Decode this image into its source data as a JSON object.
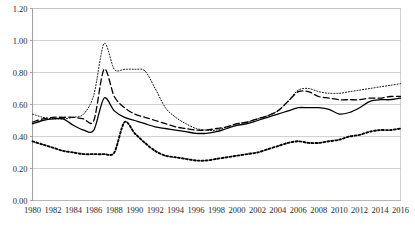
{
  "chart_data": {
    "type": "line",
    "title": "",
    "xlabel": "",
    "ylabel": "",
    "xlim": [
      1980,
      2016
    ],
    "ylim": [
      0.0,
      1.2
    ],
    "ytick_labels": [
      "0.00",
      "0.20",
      "0.40",
      "0.60",
      "0.80",
      "1.00",
      "1.20"
    ],
    "ytick_values": [
      0.0,
      0.2,
      0.4,
      0.6,
      0.8,
      1.0,
      1.2
    ],
    "xtick_labels": [
      "1980",
      "1982",
      "1984",
      "1986",
      "1988",
      "1990",
      "1992",
      "1994",
      "1996",
      "1998",
      "2000",
      "2002",
      "2004",
      "2006",
      "2008",
      "2010",
      "2012",
      "2014",
      "2016"
    ],
    "xtick_values": [
      1980,
      1982,
      1984,
      1986,
      1988,
      1990,
      1992,
      1994,
      1996,
      1998,
      2000,
      2002,
      2004,
      2006,
      2008,
      2010,
      2012,
      2014,
      2016
    ],
    "grid": true,
    "legend": null,
    "legend_position": "none",
    "x": [
      1980,
      1981,
      1982,
      1983,
      1984,
      1985,
      1986,
      1987,
      1988,
      1989,
      1990,
      1991,
      1992,
      1993,
      1994,
      1995,
      1996,
      1997,
      1998,
      1999,
      2000,
      2001,
      2002,
      2003,
      2004,
      2005,
      2006,
      2007,
      2008,
      2009,
      2010,
      2011,
      2012,
      2013,
      2014,
      2015,
      2016
    ],
    "series": [
      {
        "name": "series-fine-dotted",
        "style": "fine-dotted",
        "values": [
          0.54,
          0.52,
          0.51,
          0.51,
          0.52,
          0.54,
          0.66,
          0.98,
          0.82,
          0.82,
          0.82,
          0.81,
          0.7,
          0.58,
          0.52,
          0.48,
          0.45,
          0.44,
          0.44,
          0.46,
          0.48,
          0.49,
          0.51,
          0.53,
          0.56,
          0.62,
          0.69,
          0.7,
          0.68,
          0.67,
          0.67,
          0.68,
          0.69,
          0.7,
          0.71,
          0.72,
          0.73
        ]
      },
      {
        "name": "series-dashed",
        "style": "dashed",
        "values": [
          0.49,
          0.51,
          0.52,
          0.52,
          0.52,
          0.51,
          0.5,
          0.82,
          0.65,
          0.58,
          0.54,
          0.52,
          0.5,
          0.48,
          0.46,
          0.45,
          0.44,
          0.44,
          0.45,
          0.46,
          0.48,
          0.49,
          0.51,
          0.53,
          0.56,
          0.62,
          0.68,
          0.68,
          0.65,
          0.64,
          0.63,
          0.63,
          0.63,
          0.64,
          0.64,
          0.65,
          0.65
        ]
      },
      {
        "name": "series-solid",
        "style": "solid",
        "values": [
          0.48,
          0.5,
          0.51,
          0.51,
          0.47,
          0.44,
          0.44,
          0.64,
          0.56,
          0.52,
          0.5,
          0.48,
          0.46,
          0.45,
          0.44,
          0.43,
          0.42,
          0.42,
          0.43,
          0.45,
          0.47,
          0.48,
          0.5,
          0.52,
          0.54,
          0.56,
          0.58,
          0.58,
          0.58,
          0.57,
          0.54,
          0.55,
          0.58,
          0.62,
          0.63,
          0.63,
          0.64
        ]
      },
      {
        "name": "series-thick-dotted",
        "style": "thick-dotted",
        "values": [
          0.37,
          0.35,
          0.33,
          0.31,
          0.3,
          0.29,
          0.29,
          0.29,
          0.3,
          0.49,
          0.42,
          0.36,
          0.31,
          0.28,
          0.27,
          0.26,
          0.25,
          0.25,
          0.26,
          0.27,
          0.28,
          0.29,
          0.3,
          0.32,
          0.34,
          0.36,
          0.37,
          0.36,
          0.36,
          0.37,
          0.38,
          0.4,
          0.41,
          0.43,
          0.44,
          0.44,
          0.45
        ]
      }
    ]
  }
}
